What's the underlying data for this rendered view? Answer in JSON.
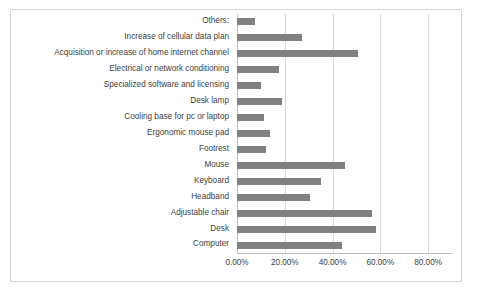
{
  "chart_data": {
    "type": "bar",
    "orientation": "horizontal",
    "title": "",
    "xlabel": "",
    "ylabel": "",
    "xlim": [
      0,
      90
    ],
    "grid": true,
    "legend": false,
    "bar_color": "#808080",
    "categories": [
      "Computer",
      "Desk",
      "Adjustable chair",
      "Headband",
      "Keyboard",
      "Mouse",
      "Footrest",
      "Ergonomic mouse pad",
      "Cooling base for pc or laptop",
      "Desk lamp",
      "Specialized software and licensing",
      "Electrical or network conditioning",
      "Acquisition or increase of home internet channel",
      "Increase of cellular data plan",
      "Others:"
    ],
    "values": [
      44.0,
      58.0,
      56.5,
      30.5,
      35.0,
      45.0,
      12.0,
      14.0,
      11.5,
      19.0,
      10.0,
      17.5,
      50.5,
      27.0,
      7.5
    ],
    "value_labels": [
      "44.00%",
      "58.00%",
      "56.50%",
      "30.50%",
      "35.00%",
      "45.00%",
      "12.00%",
      "14.00%",
      "11.50%",
      "19.00%",
      "10.00%",
      "17.50%",
      "50.50%",
      "27.00%",
      "7.50%"
    ],
    "xticks": [
      0,
      20,
      40,
      60,
      80
    ],
    "xtick_labels": [
      "0.00%",
      "20.00%",
      "40.00%",
      "60.00%",
      "80.00%"
    ]
  }
}
